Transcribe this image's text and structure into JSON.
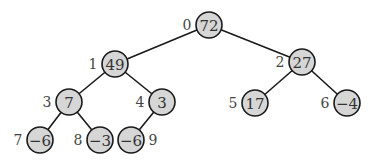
{
  "diagram": {
    "type": "binary-tree",
    "colors": {
      "node_fill": "#d6d6d6",
      "stroke": "#1a1a1a",
      "text": "#333333"
    },
    "nodes": [
      {
        "index": "0",
        "value": "72",
        "x": 209,
        "y": 25,
        "label_side": "left"
      },
      {
        "index": "1",
        "value": "49",
        "x": 115,
        "y": 64,
        "label_side": "left"
      },
      {
        "index": "2",
        "value": "27",
        "x": 302,
        "y": 62,
        "label_side": "left"
      },
      {
        "index": "3",
        "value": "7",
        "x": 69,
        "y": 102,
        "label_side": "left"
      },
      {
        "index": "4",
        "value": "3",
        "x": 162,
        "y": 102,
        "label_side": "left"
      },
      {
        "index": "5",
        "value": "17",
        "x": 255,
        "y": 103,
        "label_side": "left"
      },
      {
        "index": "6",
        "value": "−4",
        "x": 347,
        "y": 103,
        "label_side": "left"
      },
      {
        "index": "7",
        "value": "−6",
        "x": 40,
        "y": 140,
        "label_side": "left"
      },
      {
        "index": "8",
        "value": "−3",
        "x": 100,
        "y": 140,
        "label_side": "left"
      },
      {
        "index": "9",
        "value": "−6",
        "x": 131,
        "y": 140,
        "label_side": "right"
      }
    ],
    "edges": [
      [
        0,
        1
      ],
      [
        0,
        2
      ],
      [
        1,
        3
      ],
      [
        1,
        4
      ],
      [
        2,
        5
      ],
      [
        2,
        6
      ],
      [
        3,
        7
      ],
      [
        3,
        8
      ],
      [
        4,
        9
      ]
    ]
  }
}
